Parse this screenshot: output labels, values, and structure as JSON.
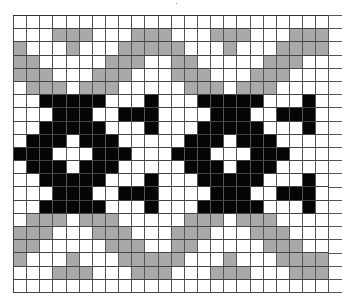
{
  "chart_title": "",
  "legend": {
    "0": {
      "name": "background",
      "color": "#ffffff"
    },
    "1": {
      "name": "contrast-gray",
      "color": "#a9a9a9"
    },
    "2": {
      "name": "motif-black",
      "color": "#050505"
    }
  },
  "grid": {
    "columns": 24,
    "rows": 21,
    "repeat_width": 12,
    "rows_data": [
      "000000000000000000000000",
      "000111000111000111000111",
      "100010001111100010001111",
      "110000011100110000011100",
      "111000111000111000111000",
      "011101110000011101110000",
      "002222200020002222200020",
      "000222002220000222002220",
      "002222200020002222200020",
      "022202220000022202220000",
      "222000222000222000222000",
      "022202220000022202220000",
      "002222200020002222200020",
      "000222002220000222002220",
      "002222200020002222200020",
      "011101110000011101110000",
      "111000111000111000111000",
      "110000011100110000011100",
      "100010001111100010001111",
      "000111000111000111000111",
      "000000000000000000000000"
    ]
  }
}
